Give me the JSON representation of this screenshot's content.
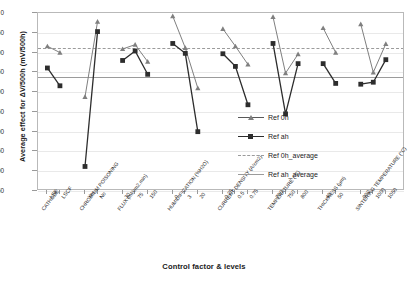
{
  "chart_data": {
    "type": "line",
    "title": "",
    "xlabel": "Control factor & levels",
    "ylabel": "Average effect for ΔV/500h (mV/500h)",
    "ylim": [
      -450,
      0
    ],
    "yticks": [
      0,
      -50,
      -100,
      -150,
      -200,
      -250,
      -300,
      -350,
      -400,
      -450
    ],
    "ytick_labels": [
      "0",
      "-50",
      "-100",
      "-150",
      "-200",
      "-250",
      "-300",
      "-350",
      "-400",
      "-450"
    ],
    "grid": true,
    "legend_position": "right-center",
    "legend": [
      "Ref 0h",
      "Ref ah",
      "Ref 0h_average",
      "Ref ah_average"
    ],
    "reference_lines": [
      {
        "name": "Ref 0h_average",
        "value": -88,
        "style": "dashed"
      },
      {
        "name": "Ref ah_average",
        "value": -162,
        "style": "solid"
      }
    ],
    "groups": [
      {
        "factor": "CATHODE",
        "levels": [
          "LSF",
          "LSCF"
        ],
        "series": {
          "Ref 0h": [
            -84,
            -100
          ],
          "Ref ah": [
            -139,
            -184
          ]
        }
      },
      {
        "factor": "CHROMIUM POISONING",
        "levels": [
          "Yes",
          "No"
        ],
        "series": {
          "Ref 0h": [
            -212,
            -22
          ],
          "Ref ah": [
            -388,
            -47
          ]
        }
      },
      {
        "factor": "FLUX (ml/cm2.min)",
        "levels": [
          "30",
          "75",
          "150"
        ],
        "series": {
          "Ref 0h": [
            -91,
            -80,
            -123
          ],
          "Ref ah": [
            -120,
            -96,
            -155
          ]
        }
      },
      {
        "factor": "HUMIDIFICATION (%H2O)",
        "levels": [
          "0",
          "3",
          "20"
        ],
        "series": {
          "Ref 0h": [
            -8,
            -88,
            -190
          ],
          "Ref ah": [
            -77,
            -102,
            -300
          ]
        }
      },
      {
        "factor": "CURRENT DENSITY (A/cm2)",
        "levels": [
          "0.25",
          "0.5",
          "0.75"
        ],
        "series": {
          "Ref 0h": [
            -40,
            -84,
            -130
          ],
          "Ref ah": [
            -103,
            -135,
            -232
          ]
        }
      },
      {
        "factor": "TEMPERATURE (°C)",
        "levels": [
          "700",
          "750",
          "800"
        ],
        "series": {
          "Ref 0h": [
            -10,
            -152,
            -104
          ],
          "Ref ah": [
            -77,
            -255,
            -128
          ]
        }
      },
      {
        "factor": "THICKNESS (µm)",
        "levels": [
          "40",
          "50"
        ],
        "series": {
          "Ref 0h": [
            -38,
            -100
          ],
          "Ref ah": [
            -128,
            -178
          ]
        }
      },
      {
        "factor": "SINTERING TEMPERATURE (°C)",
        "levels": [
          "900",
          "1000",
          "1050"
        ],
        "series": {
          "Ref 0h": [
            -28,
            -150,
            -78
          ],
          "Ref ah": [
            -180,
            -175,
            -118
          ]
        }
      }
    ],
    "colors": {
      "ref_0h": "#7f7f7f",
      "ref_ah": "#2d2d2d",
      "ref_0h_average": "#9b9b9b",
      "ref_ah_average": "#9b9b9b",
      "grid": "#e9e9e9",
      "axis": "#b9b9b9"
    }
  },
  "axis_titles": {
    "x": "Control factor & levels",
    "y": "Average effect for ΔV/500h (mV/500h)"
  },
  "legend": {
    "items": [
      {
        "label": "Ref 0h",
        "marker": "triangle",
        "style": "solid"
      },
      {
        "label": "Ref ah",
        "marker": "square",
        "style": "solid"
      },
      {
        "label": "Ref 0h_average",
        "marker": "none",
        "style": "dashed"
      },
      {
        "label": "Ref ah_average",
        "marker": "none",
        "style": "solid"
      }
    ]
  }
}
